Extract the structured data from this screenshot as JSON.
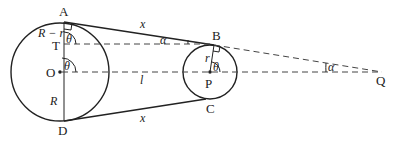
{
  "diagram": {
    "type": "belt-and-pulleys-geometry",
    "points": {
      "A": "A",
      "B": "B",
      "C": "C",
      "D": "D",
      "O": "O",
      "P": "P",
      "T": "T",
      "Q": "Q"
    },
    "labels": {
      "x_top": "x",
      "x_bottom": "x",
      "l": "l",
      "R": "R",
      "r": "r",
      "R_minus_r": "R − r",
      "theta_T": "θ",
      "theta_O": "θ",
      "theta_P": "θ",
      "alpha_B": "α",
      "alpha_Q": "α"
    },
    "colors": {
      "line": "#222222",
      "dashed": "#444444",
      "background": "#ffffff"
    }
  }
}
